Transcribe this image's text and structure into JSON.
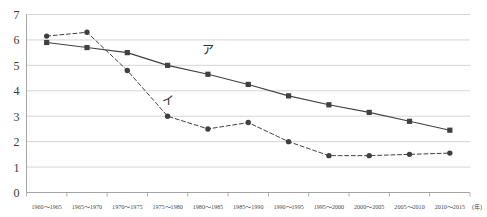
{
  "chart_data": {
    "type": "line",
    "title": "",
    "subtitle": "",
    "xlabel": "(年)",
    "ylabel": "",
    "ylim": [
      0,
      7
    ],
    "yticks": [
      "0",
      "1",
      "2",
      "3",
      "4",
      "5",
      "6",
      "7"
    ],
    "grid": true,
    "legend_position": "inline-annotation",
    "categories": [
      "1960～1965",
      "1965～1970",
      "1970～1975",
      "1975～1980",
      "1980～1985",
      "1985～1990",
      "1990～1995",
      "1995～2000",
      "2000～2005",
      "2005～2010",
      "2010～2015"
    ],
    "series": [
      {
        "name": "ア",
        "style": "solid",
        "marker": "square",
        "color": "#404040",
        "values": [
          5.9,
          5.7,
          5.5,
          5.0,
          4.65,
          4.25,
          3.8,
          3.45,
          3.15,
          2.8,
          2.45
        ]
      },
      {
        "name": "イ",
        "style": "dashed",
        "marker": "circle",
        "color": "#404040",
        "values": [
          6.15,
          6.3,
          4.8,
          3.0,
          2.5,
          2.75,
          2.0,
          1.45,
          1.45,
          1.5,
          1.55
        ]
      }
    ],
    "annotations": [
      {
        "text": "ア",
        "x_category_index": 4,
        "y_value": 5.45
      },
      {
        "text": "イ",
        "x_category_index": 3,
        "y_value": 3.45
      }
    ]
  }
}
